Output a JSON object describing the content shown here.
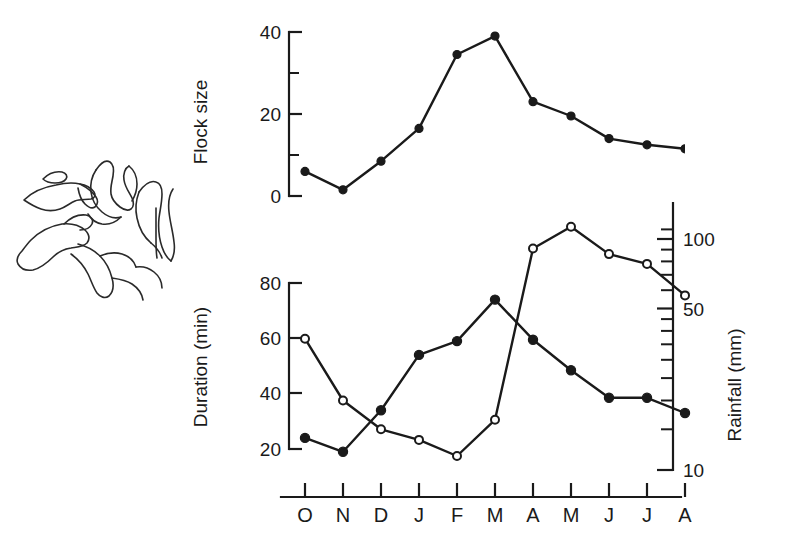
{
  "figure": {
    "name": "seasonal-flock-duration-rainfall-figure",
    "background_color": "#ffffff",
    "ink_color": "#1a1a1a"
  },
  "illustration": {
    "name": "flock-of-birds-in-flight",
    "description": "line drawing of a flock of birds in flight",
    "stroke_color": "#2a2a2a"
  },
  "x_axis": {
    "label": "",
    "tick_labels": [
      "O",
      "N",
      "D",
      "J",
      "F",
      "M",
      "A",
      "M",
      "J",
      "J",
      "A"
    ],
    "categories": [
      "O",
      "N",
      "D",
      "J",
      "F",
      "M",
      "A",
      "M",
      "J",
      "J",
      "A"
    ]
  },
  "chart_data": [
    {
      "type": "line",
      "name": "flock-size-panel",
      "title": "",
      "xlabel": "",
      "ylabel": "Flock size",
      "categories": [
        "O",
        "N",
        "D",
        "J",
        "F",
        "M",
        "A",
        "M",
        "J",
        "J",
        "A"
      ],
      "values": [
        6,
        1.5,
        8.5,
        16.5,
        34.5,
        39,
        23,
        19.5,
        14,
        12.5,
        11.5
      ],
      "ylim": [
        0,
        40
      ],
      "yticks": [
        0,
        20,
        40
      ],
      "ytick_labels": [
        "0",
        "20",
        "40"
      ],
      "yminor_ticks": [
        10,
        30
      ],
      "grid": false,
      "marker": "filled-circle",
      "legend": "none"
    },
    {
      "type": "line",
      "name": "duration-rainfall-panel",
      "title": "",
      "xlabel": "",
      "ylabel": "Duration (min)",
      "y2label": "Rainfall (mm)",
      "categories": [
        "O",
        "N",
        "D",
        "J",
        "F",
        "M",
        "A",
        "M",
        "J",
        "J",
        "A"
      ],
      "ylim": [
        20,
        80
      ],
      "yticks": [
        20,
        40,
        60,
        80
      ],
      "ytick_labels": [
        "20",
        "40",
        "60",
        "80"
      ],
      "y2_scale": "log",
      "y2lim": [
        10,
        115
      ],
      "y2ticks": [
        10,
        50,
        100
      ],
      "y2tick_labels": [
        "10",
        "50",
        "100"
      ],
      "y2minor_ticks": [
        15,
        20,
        25,
        30,
        35,
        40,
        45,
        60,
        70,
        80,
        90,
        110
      ],
      "grid": false,
      "legend": "none",
      "series": [
        {
          "name": "Duration (min)",
          "axis": "left",
          "marker": "filled-circle",
          "values": [
            24,
            19,
            34,
            54,
            59,
            74,
            59.5,
            48.5,
            38.5,
            38.5,
            33
          ]
        },
        {
          "name": "Rainfall (mm)",
          "axis": "right",
          "marker": "open-circle",
          "values": [
            37,
            20,
            15,
            13.5,
            11.5,
            16.5,
            91,
            113,
            86,
            78,
            57
          ]
        }
      ]
    }
  ]
}
